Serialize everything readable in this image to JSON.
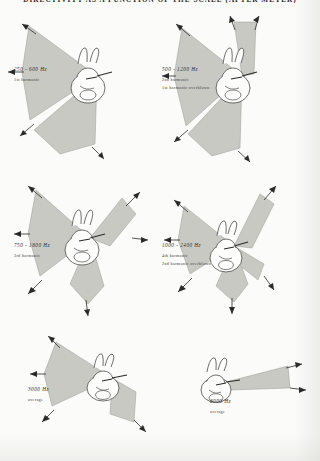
{
  "figure": {
    "running_head": "DIRECTIVITY AS A FUNCTION OF THE SCALE (AFTER MEYER)",
    "background_color": "#fbfbf9",
    "lobe_fill_color": "#c9c9c4",
    "lobe_stroke_color": "#8d8d88",
    "arrow_color": "#2b2b2b"
  },
  "panels": [
    {
      "id": "panel-250-600",
      "freq": "250 - 600 Hz",
      "sub1": "1st harmonic",
      "sub2": "",
      "lobes": [
        {
          "start_deg": 200,
          "end_deg": 250,
          "radius": 66
        },
        {
          "start_deg": 115,
          "end_deg": 162,
          "radius": 62
        }
      ],
      "arrows": [
        {
          "angle_deg": 203,
          "len": 78
        },
        {
          "angle_deg": 248,
          "len": 74
        },
        {
          "angle_deg": 158,
          "len": 72
        },
        {
          "angle_deg": 118,
          "len": 70
        }
      ]
    },
    {
      "id": "panel-500-1200",
      "freq": "500 - 1200 Hz",
      "sub1": "2nd harmonic",
      "sub2": "1st harmonic overblown",
      "lobes": [
        {
          "start_deg": 196,
          "end_deg": 252,
          "radius": 70
        },
        {
          "start_deg": 118,
          "end_deg": 150,
          "radius": 64
        }
      ],
      "arrows": [
        {
          "angle_deg": 196,
          "len": 82
        },
        {
          "angle_deg": 252,
          "len": 80
        },
        {
          "angle_deg": 150,
          "len": 76
        },
        {
          "angle_deg": 120,
          "len": 74
        }
      ]
    },
    {
      "id": "panel-750-1800",
      "freq": "750 - 1800 Hz",
      "sub1": "3rd harmonic",
      "sub2": "",
      "lobes": [
        {
          "start_deg": 198,
          "end_deg": 248,
          "radius": 64
        },
        {
          "start_deg": 118,
          "end_deg": 152,
          "radius": 58
        },
        {
          "start_deg": 72,
          "end_deg": 100,
          "radius": 70
        }
      ],
      "arrows": [
        {
          "angle_deg": 198,
          "len": 78
        },
        {
          "angle_deg": 248,
          "len": 74
        },
        {
          "angle_deg": 152,
          "len": 70
        },
        {
          "angle_deg": 100,
          "len": 80
        },
        {
          "angle_deg": 70,
          "len": 78
        }
      ]
    },
    {
      "id": "panel-1000-2400",
      "freq": "1000 - 2400 Hz",
      "sub1": "4th harmonic",
      "sub2": "2nd harmonic overblown",
      "lobes": [
        {
          "start_deg": 206,
          "end_deg": 250,
          "radius": 60
        },
        {
          "start_deg": 120,
          "end_deg": 158,
          "radius": 56
        },
        {
          "start_deg": 64,
          "end_deg": 98,
          "radius": 66
        }
      ],
      "arrows": [
        {
          "angle_deg": 206,
          "len": 72
        },
        {
          "angle_deg": 250,
          "len": 70
        },
        {
          "angle_deg": 158,
          "len": 66
        },
        {
          "angle_deg": 98,
          "len": 76
        },
        {
          "angle_deg": 62,
          "len": 74
        }
      ]
    },
    {
      "id": "panel-3000",
      "freq": "3000 Hz",
      "sub1": "average",
      "sub2": "",
      "lobes": [
        {
          "start_deg": 186,
          "end_deg": 250,
          "radius": 62
        },
        {
          "start_deg": 120,
          "end_deg": 150,
          "radius": 58
        }
      ],
      "arrows": [
        {
          "angle_deg": 186,
          "len": 74
        },
        {
          "angle_deg": 250,
          "len": 72
        },
        {
          "angle_deg": 150,
          "len": 68
        },
        {
          "angle_deg": 122,
          "len": 66
        }
      ]
    },
    {
      "id": "panel-8000",
      "freq": "8000 Hz",
      "sub1": "average",
      "sub2": "",
      "lobes": [
        {
          "start_deg": 200,
          "end_deg": 228,
          "radius": 58
        }
      ],
      "arrows": [
        {
          "angle_deg": 200,
          "len": 68
        },
        {
          "angle_deg": 230,
          "len": 66
        }
      ]
    }
  ]
}
